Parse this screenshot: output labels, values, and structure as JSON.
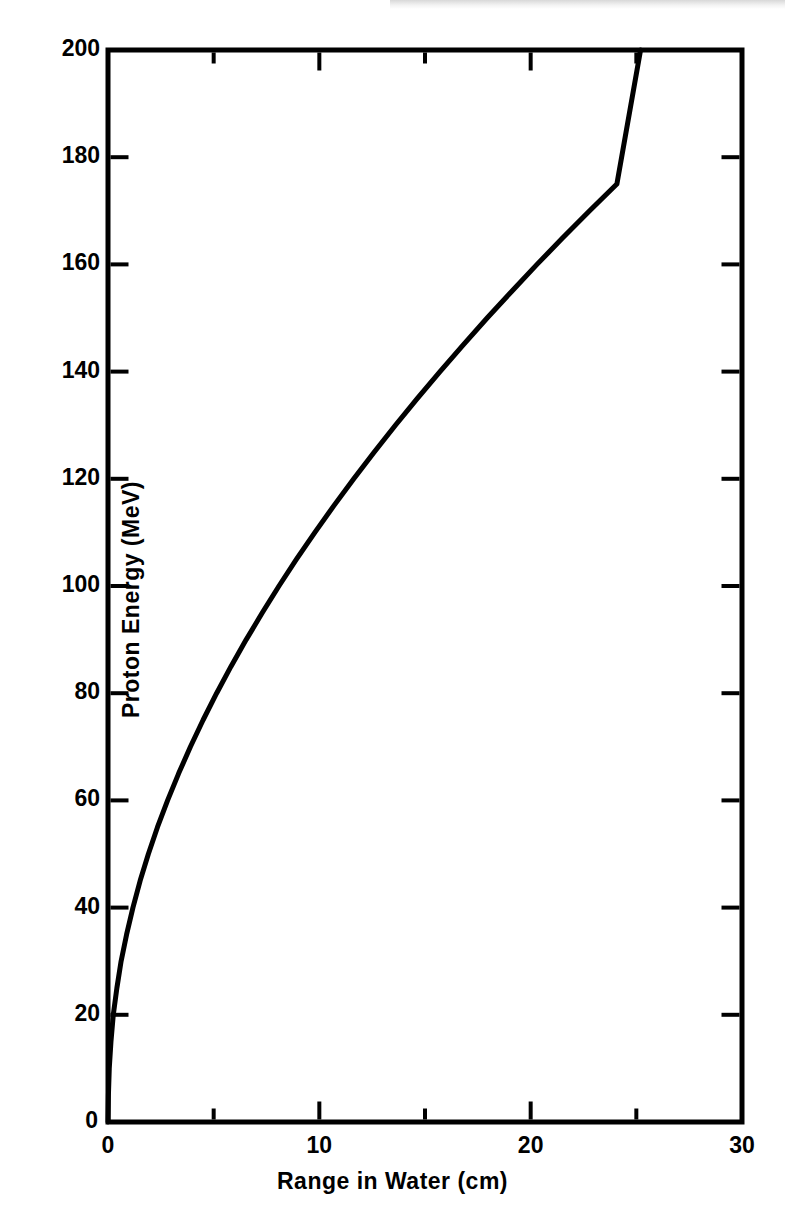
{
  "figure": {
    "background_color": "#ffffff",
    "ink_color": "#000000"
  },
  "chart_data": {
    "type": "line",
    "title": "",
    "subtitle": "",
    "xlabel": "Range in Water (cm)",
    "ylabel": "Proton Energy (MeV)",
    "xlim": [
      0,
      30
    ],
    "ylim": [
      0,
      200
    ],
    "grid": false,
    "legend": null,
    "legend_position": "none",
    "x_major_ticks": [
      0,
      10,
      20,
      30
    ],
    "x_minor_ticks": [
      5,
      15,
      25
    ],
    "x_tick_labels": [
      "0",
      "10",
      "20",
      "30"
    ],
    "y_major_ticks": [
      0,
      20,
      40,
      60,
      80,
      100,
      120,
      140,
      160,
      180,
      200
    ],
    "y_tick_labels": [
      "0",
      "20",
      "40",
      "60",
      "80",
      "100",
      "120",
      "140",
      "160",
      "180",
      "200"
    ],
    "series": [
      {
        "name": "Proton range-energy relation in water",
        "x": [
          0.0,
          0.02,
          0.06,
          0.14,
          0.25,
          0.42,
          0.62,
          0.88,
          1.18,
          1.52,
          1.91,
          2.34,
          2.82,
          3.34,
          3.9,
          4.5,
          5.14,
          5.82,
          6.54,
          7.3,
          8.09,
          8.92,
          9.79,
          10.69,
          11.63,
          12.6,
          13.6,
          14.64,
          15.71,
          16.81,
          17.94,
          19.11,
          20.3,
          21.53,
          22.79,
          24.08,
          25.2
        ],
        "y": [
          0,
          5,
          10,
          15,
          20,
          25,
          30,
          35,
          40,
          45,
          50,
          55,
          60,
          65,
          70,
          75,
          80,
          85,
          90,
          95,
          100,
          105,
          110,
          115,
          120,
          125,
          130,
          135,
          140,
          145,
          150,
          155,
          160,
          165,
          170,
          175,
          200
        ],
        "line_color": "#000000",
        "line_width": 5,
        "marker": "none"
      }
    ],
    "annotations": []
  },
  "plot_frame": {
    "left_px": 108,
    "right_px": 742,
    "top_px": 50,
    "bottom_px": 1122,
    "border_width_px": 5,
    "tick_direction": "inward",
    "major_tick_len_px": 18,
    "minor_tick_len_px": 11
  },
  "axes": {
    "x": {
      "label": "Range in Water (cm)",
      "labels": [
        "0",
        "10",
        "20",
        "30"
      ],
      "label_values": [
        0,
        10,
        20,
        30
      ],
      "minor_values": [
        5,
        15,
        25
      ]
    },
    "y": {
      "label": "Proton Energy (MeV)",
      "labels": [
        "200",
        "180",
        "160",
        "140",
        "120",
        "100",
        "80",
        "60",
        "40",
        "20",
        "0"
      ],
      "label_values": [
        200,
        180,
        160,
        140,
        120,
        100,
        80,
        60,
        40,
        20,
        0
      ]
    }
  }
}
